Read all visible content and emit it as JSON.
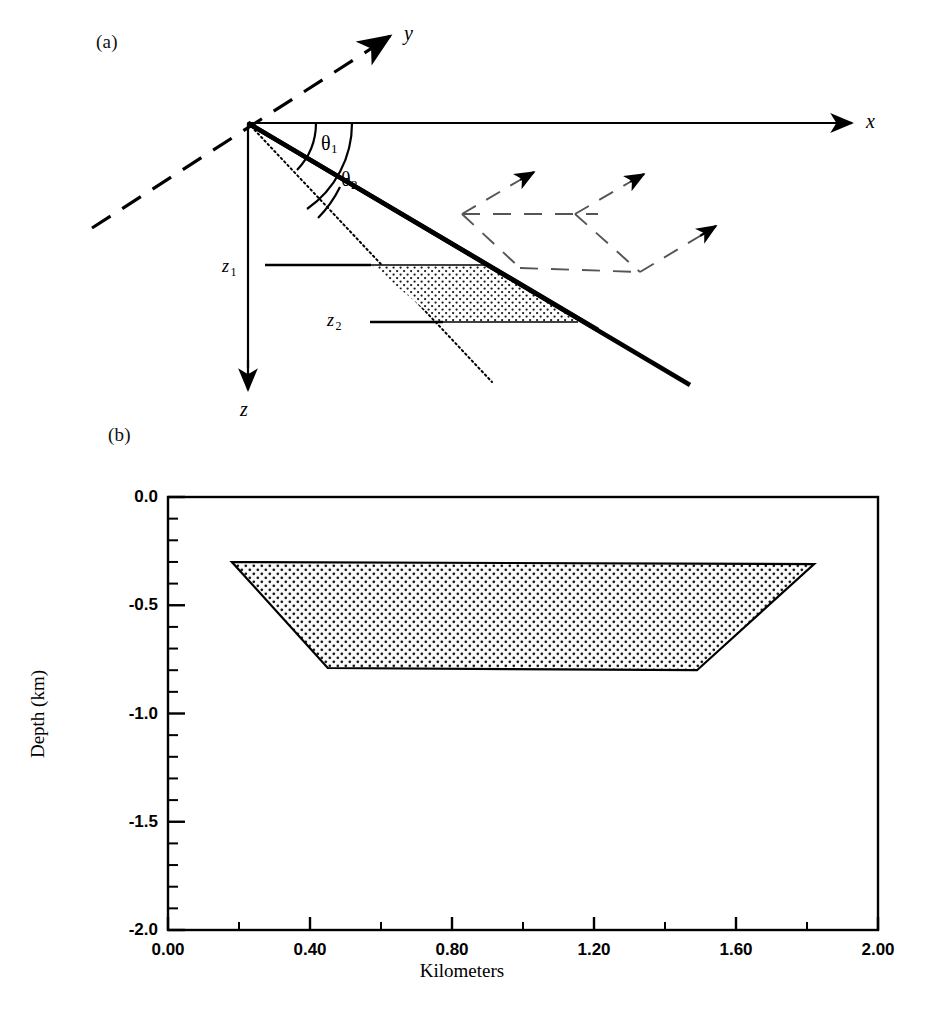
{
  "figure": {
    "panel_a": {
      "label": "(a)",
      "axes": {
        "x": "x",
        "y": "y",
        "z": "z"
      },
      "angles": [
        {
          "name": "theta1",
          "base": "θ",
          "sub": "1"
        },
        {
          "name": "theta2",
          "base": "θ",
          "sub": "2"
        }
      ],
      "depth_markers": [
        {
          "name": "z1",
          "base": "z",
          "sub": "1"
        },
        {
          "name": "z2",
          "base": "z",
          "sub": "2"
        }
      ]
    },
    "panel_b": {
      "label": "(b)"
    }
  },
  "chart_data": {
    "type": "area",
    "title": "",
    "xlabel": "Kilometers",
    "ylabel": "Depth (km)",
    "xlim": [
      0.0,
      2.0
    ],
    "ylim": [
      -2.0,
      0.0
    ],
    "grid": false,
    "legend": "none",
    "xticks": [
      0.0,
      0.4,
      0.8,
      1.2,
      1.6,
      2.0
    ],
    "xticklabels": [
      "0.00",
      "0.40",
      "0.80",
      "1.20",
      "1.60",
      "2.00"
    ],
    "x_minor_step": 0.2,
    "yticks": [
      0.0,
      -0.5,
      -1.0,
      -1.5,
      -2.0
    ],
    "yticklabels": [
      "0.0",
      "-0.5",
      "-1.0",
      "-1.5",
      "-2.0"
    ],
    "y_minor_step": 0.1,
    "series": [
      {
        "name": "dipping layer body",
        "fill": "stipple",
        "polygon": [
          {
            "x": 0.18,
            "y": -0.3
          },
          {
            "x": 1.82,
            "y": -0.31
          },
          {
            "x": 1.49,
            "y": -0.8
          },
          {
            "x": 0.45,
            "y": -0.79
          }
        ]
      }
    ]
  }
}
